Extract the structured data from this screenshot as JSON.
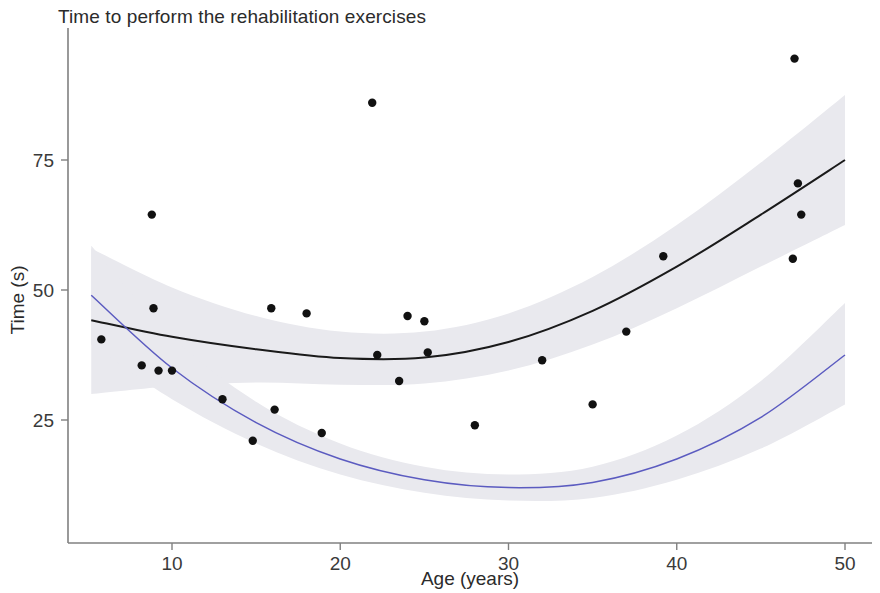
{
  "chart_data": {
    "type": "scatter",
    "title": "Time to perform the rehabilitation exercises",
    "xlabel": "Age (years)",
    "ylabel": "Time (s)",
    "xlim": [
      5,
      50.5
    ],
    "ylim": [
      4,
      100
    ],
    "xticks": [
      10,
      20,
      30,
      40,
      50
    ],
    "yticks": [
      25,
      50,
      75
    ],
    "grid": false,
    "legend": "none",
    "points": [
      {
        "x": 5.8,
        "y": 40.5
      },
      {
        "x": 8.2,
        "y": 35.5
      },
      {
        "x": 8.8,
        "y": 64.5
      },
      {
        "x": 8.9,
        "y": 46.5
      },
      {
        "x": 9.2,
        "y": 34.5
      },
      {
        "x": 10.0,
        "y": 34.5
      },
      {
        "x": 13.0,
        "y": 29.0
      },
      {
        "x": 14.8,
        "y": 21.0
      },
      {
        "x": 15.9,
        "y": 46.5
      },
      {
        "x": 16.1,
        "y": 27.0
      },
      {
        "x": 18.0,
        "y": 45.5
      },
      {
        "x": 18.9,
        "y": 22.5
      },
      {
        "x": 21.9,
        "y": 86.0
      },
      {
        "x": 22.2,
        "y": 37.5
      },
      {
        "x": 23.5,
        "y": 32.5
      },
      {
        "x": 24.0,
        "y": 45.0
      },
      {
        "x": 25.0,
        "y": 44.0
      },
      {
        "x": 25.2,
        "y": 38.0
      },
      {
        "x": 28.0,
        "y": 24.0
      },
      {
        "x": 32.0,
        "y": 36.5
      },
      {
        "x": 35.0,
        "y": 28.0
      },
      {
        "x": 37.0,
        "y": 42.0
      },
      {
        "x": 39.2,
        "y": 56.5
      },
      {
        "x": 46.9,
        "y": 56.0
      },
      {
        "x": 47.0,
        "y": 94.5
      },
      {
        "x": 47.2,
        "y": 70.5
      },
      {
        "x": 47.4,
        "y": 64.5
      }
    ],
    "series": [
      {
        "name": "upper-fit-curve",
        "color": "#1a1a1a",
        "kind": "quadratic-fit",
        "fit_points": [
          {
            "x": 5.2,
            "y": 44.2
          },
          {
            "x": 10,
            "y": 41.0
          },
          {
            "x": 15,
            "y": 38.6
          },
          {
            "x": 20,
            "y": 36.9
          },
          {
            "x": 25,
            "y": 37.0
          },
          {
            "x": 30,
            "y": 40.0
          },
          {
            "x": 35,
            "y": 46.0
          },
          {
            "x": 40,
            "y": 54.5
          },
          {
            "x": 45,
            "y": 64.5
          },
          {
            "x": 50,
            "y": 75.0
          }
        ],
        "band_upper": [
          {
            "x": 5.2,
            "y": 58.0
          },
          {
            "x": 10,
            "y": 50.5
          },
          {
            "x": 15,
            "y": 45.0
          },
          {
            "x": 20,
            "y": 42.0
          },
          {
            "x": 25,
            "y": 42.0
          },
          {
            "x": 30,
            "y": 45.5
          },
          {
            "x": 35,
            "y": 52.5
          },
          {
            "x": 40,
            "y": 62.5
          },
          {
            "x": 45,
            "y": 74.5
          },
          {
            "x": 50,
            "y": 87.5
          }
        ],
        "band_lower": [
          {
            "x": 5.2,
            "y": 30.0
          },
          {
            "x": 10,
            "y": 31.5
          },
          {
            "x": 15,
            "y": 32.2
          },
          {
            "x": 20,
            "y": 31.8
          },
          {
            "x": 25,
            "y": 32.0
          },
          {
            "x": 30,
            "y": 34.5
          },
          {
            "x": 35,
            "y": 39.5
          },
          {
            "x": 40,
            "y": 46.5
          },
          {
            "x": 45,
            "y": 54.5
          },
          {
            "x": 50,
            "y": 62.5
          }
        ]
      },
      {
        "name": "lower-fit-curve",
        "color": "#5b5bc0",
        "kind": "quadratic-fit",
        "fit_points": [
          {
            "x": 5.2,
            "y": 49.0
          },
          {
            "x": 10,
            "y": 35.0
          },
          {
            "x": 15,
            "y": 24.5
          },
          {
            "x": 20,
            "y": 17.5
          },
          {
            "x": 25,
            "y": 13.5
          },
          {
            "x": 30,
            "y": 12.0
          },
          {
            "x": 35,
            "y": 13.0
          },
          {
            "x": 40,
            "y": 17.5
          },
          {
            "x": 45,
            "y": 25.5
          },
          {
            "x": 50,
            "y": 37.5
          }
        ],
        "band_upper": [
          {
            "x": 5.2,
            "y": 58.5
          },
          {
            "x": 10,
            "y": 41.0
          },
          {
            "x": 15,
            "y": 28.5
          },
          {
            "x": 20,
            "y": 20.5
          },
          {
            "x": 25,
            "y": 16.0
          },
          {
            "x": 30,
            "y": 14.5
          },
          {
            "x": 35,
            "y": 16.0
          },
          {
            "x": 40,
            "y": 22.0
          },
          {
            "x": 45,
            "y": 32.5
          },
          {
            "x": 50,
            "y": 47.5
          }
        ],
        "band_lower": [
          {
            "x": 5.2,
            "y": 39.5
          },
          {
            "x": 10,
            "y": 29.0
          },
          {
            "x": 15,
            "y": 20.5
          },
          {
            "x": 20,
            "y": 14.5
          },
          {
            "x": 25,
            "y": 11.0
          },
          {
            "x": 30,
            "y": 9.5
          },
          {
            "x": 35,
            "y": 10.0
          },
          {
            "x": 40,
            "y": 13.5
          },
          {
            "x": 45,
            "y": 19.5
          },
          {
            "x": 50,
            "y": 28.0
          }
        ]
      }
    ]
  },
  "colors": {
    "point": "#111111",
    "upper_curve": "#1a1a1a",
    "lower_curve": "#5b5bc0",
    "band": "#e9e9ee",
    "axis": "#808080",
    "text": "#2b2b2b"
  }
}
